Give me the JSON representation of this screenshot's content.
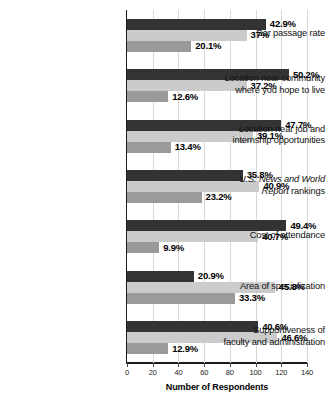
{
  "chart_data": {
    "type": "bar",
    "orientation": "horizontal",
    "title": "",
    "xlabel": "Number of Respondents",
    "ylabel": "",
    "xlim": [
      0,
      140
    ],
    "xticks": [
      0,
      20,
      40,
      60,
      80,
      100,
      120,
      140
    ],
    "xtick_labels": [
      "0",
      "20",
      "40",
      "60",
      "80",
      "100",
      "120",
      "140"
    ],
    "grid": true,
    "grid_axis": "x",
    "legend": "none",
    "categories": [
      "Bar passage rate",
      "Location near community where you hope to live",
      "Location near job and internship opportunities",
      "U.S. News and World Report rankings",
      "Cost of attendance",
      "Area of specialization",
      "Supportiveness of faculty and administration"
    ],
    "series": [
      {
        "name": "series-1",
        "color": "#333333",
        "values": [
          108,
          126,
          120,
          90,
          124,
          52,
          102
        ],
        "data_labels": [
          "42.9%",
          "50.2%",
          "47.7%",
          "35.8%",
          "49.4%",
          "20.9%",
          "40.6%"
        ]
      },
      {
        "name": "series-2",
        "color": "#cbcbcb",
        "values": [
          93,
          93,
          98,
          103,
          102,
          115,
          117
        ],
        "data_labels": [
          "37%",
          "37.2%",
          "39.1%",
          "40.9%",
          "40.7%",
          "45.8%",
          "46.6%"
        ]
      },
      {
        "name": "series-3",
        "color": "#9a9a9a",
        "values": [
          50,
          32,
          34,
          58,
          25,
          84,
          32
        ],
        "data_labels": [
          "20.1%",
          "12.6%",
          "13.4%",
          "23.2%",
          "9.9%",
          "33.3%",
          "12.9%"
        ]
      }
    ]
  },
  "axis": {
    "xlabel": "Number of Respondents",
    "ticks": [
      "0",
      "20",
      "40",
      "60",
      "80",
      "100",
      "120",
      "140"
    ]
  },
  "categories": [
    {
      "lines": [
        {
          "text": "Bar passage rate",
          "italic": false
        }
      ]
    },
    {
      "lines": [
        {
          "text": "Location near community",
          "italic": false
        },
        {
          "text": "where you hope to live",
          "italic": false
        }
      ]
    },
    {
      "lines": [
        {
          "text": "Location near job and",
          "italic": false
        },
        {
          "text": "internship opportunities",
          "italic": false
        }
      ]
    },
    {
      "lines": [
        {
          "text": "U.S. News and World",
          "italic": true
        },
        {
          "text": "Report rankings",
          "italic": "mixed",
          "italic_part": "Report",
          "roman_part": " rankings"
        }
      ]
    },
    {
      "lines": [
        {
          "text": "Cost of attendance",
          "italic": false
        }
      ]
    },
    {
      "lines": [
        {
          "text": "Area of specialization",
          "italic": false
        }
      ]
    },
    {
      "lines": [
        {
          "text": "Supportiveness of",
          "italic": false
        },
        {
          "text": "faculty and administration",
          "italic": false
        }
      ]
    }
  ],
  "colors": {
    "series_1": "#333333",
    "series_2": "#cbcbcb",
    "series_3": "#9a9a9a",
    "axis": "#1a1a1a",
    "grid": "#d8d8d8",
    "text": "#111111",
    "background": "#ffffff"
  }
}
